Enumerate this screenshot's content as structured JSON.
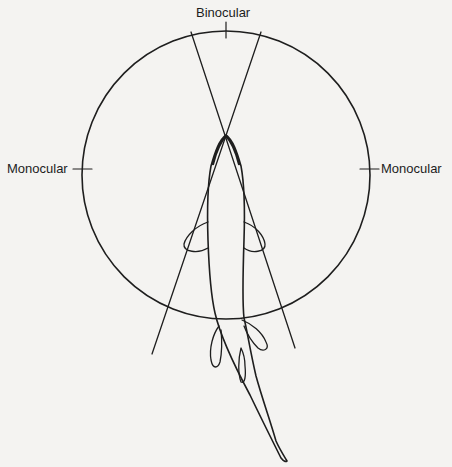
{
  "figure": {
    "labels": {
      "top": "Binocular",
      "left": "Monocular",
      "right": "Monocular"
    },
    "colors": {
      "line": "#1e1e1e",
      "background": "#f4f3f1"
    },
    "circle": {
      "cx": 226,
      "cy": 175,
      "r": 144
    }
  }
}
